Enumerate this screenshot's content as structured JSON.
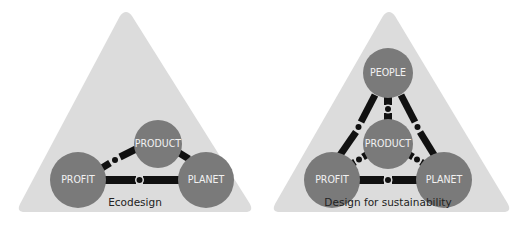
{
  "colors": {
    "triangle": "#dcdcdc",
    "node": "#7a7a7a",
    "connector": "#111111",
    "node_text": "#f2f2f2",
    "caption_text": "#222222"
  },
  "diagrams": [
    {
      "caption": "Ecodesign",
      "nodes": [
        {
          "id": "product",
          "label": "PRODUCT"
        },
        {
          "id": "profit",
          "label": "PROFIT"
        },
        {
          "id": "planet",
          "label": "PLANET"
        }
      ],
      "connections": [
        [
          "profit",
          "product"
        ],
        [
          "product",
          "planet"
        ],
        [
          "profit",
          "planet"
        ]
      ]
    },
    {
      "caption": "Design for sustainability",
      "nodes": [
        {
          "id": "people",
          "label": "PEOPLE"
        },
        {
          "id": "product",
          "label": "PRODUCT"
        },
        {
          "id": "profit",
          "label": "PROFIT"
        },
        {
          "id": "planet",
          "label": "PLANET"
        }
      ],
      "connections": [
        [
          "people",
          "product"
        ],
        [
          "people",
          "profit"
        ],
        [
          "people",
          "planet"
        ],
        [
          "profit",
          "product"
        ],
        [
          "product",
          "planet"
        ],
        [
          "profit",
          "planet"
        ]
      ]
    }
  ]
}
